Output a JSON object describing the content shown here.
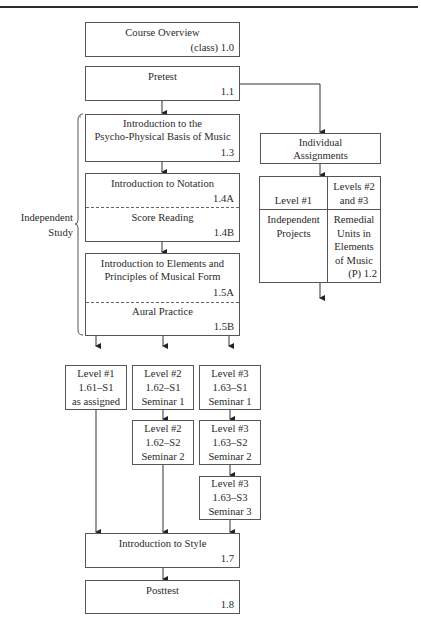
{
  "diagram": {
    "course_overview": {
      "title": "Course Overview",
      "code": "(class) 1.0"
    },
    "pretest": {
      "title": "Pretest",
      "code": "1.1"
    },
    "psycho_physical": {
      "line1": "Introduction to the",
      "line2": "Psycho-Physical Basis of Music",
      "code": "1.3"
    },
    "notation": {
      "title": "Introduction to Notation",
      "code": "1.4A"
    },
    "score_reading": {
      "title": "Score Reading",
      "code": "1.4B"
    },
    "elements": {
      "line1": "Introduction to Elements and",
      "line2": "Principles of Musical Form",
      "code": "1.5A"
    },
    "aural": {
      "title": "Aural Practice",
      "code": "1.5B"
    },
    "independent_study": {
      "line1": "Independent",
      "line2": "Study"
    },
    "individual_assignments": {
      "line1": "Individual",
      "line2": "Assignments"
    },
    "assignment_table": {
      "col1_header": "Level #1",
      "col2_header_line1": "Levels #2",
      "col2_header_line2": "and #3",
      "col1_body_line1": "Independent",
      "col1_body_line2": "Projects",
      "col2_body_line1": "Remedial",
      "col2_body_line2": "Units in",
      "col2_body_line3": "Elements",
      "col2_body_line4": "of Music",
      "col2_code": "(P) 1.2"
    },
    "levels": [
      {
        "line1": "Level #1",
        "line2": "1.61–S1",
        "line3": "as assigned"
      },
      {
        "line1": "Level #2",
        "line2": "1.62–S1",
        "line3": "Seminar 1"
      },
      {
        "line1": "Level #3",
        "line2": "1.63–S1",
        "line3": "Seminar 1"
      },
      {
        "line1": "Level #2",
        "line2": "1.62–S2",
        "line3": "Seminar 2"
      },
      {
        "line1": "Level #3",
        "line2": "1.63–S2",
        "line3": "Seminar 2"
      },
      {
        "line1": "Level #3",
        "line2": "1.63–S3",
        "line3": "Seminar 3"
      }
    ],
    "intro_style": {
      "title": "Introduction to Style",
      "code": "1.7"
    },
    "posttest": {
      "title": "Posttest",
      "code": "1.8"
    }
  }
}
